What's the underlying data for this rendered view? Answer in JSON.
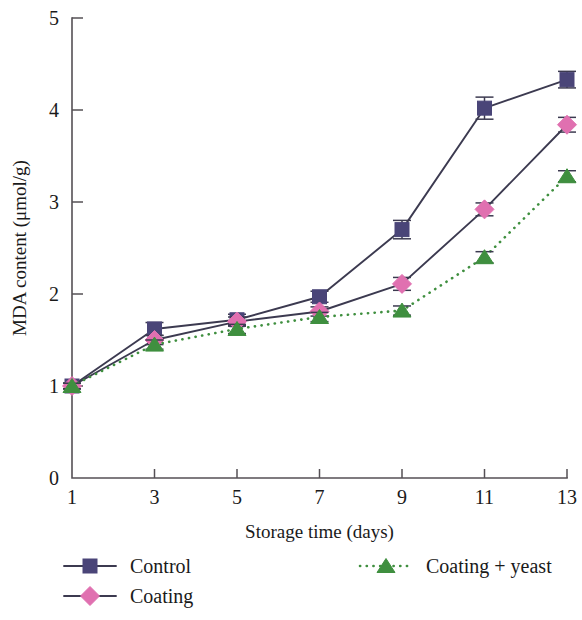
{
  "chart_data": {
    "type": "line",
    "title": "",
    "xlabel": "Storage time (days)",
    "ylabel": "MDA content (μmol/g)",
    "x": [
      1,
      3,
      5,
      7,
      9,
      11,
      13
    ],
    "xtick_labels": [
      "1",
      "3",
      "5",
      "7",
      "9",
      "11",
      "13"
    ],
    "ytick_labels": [
      "0",
      "1",
      "2",
      "3",
      "4",
      "5"
    ],
    "yticks": [
      0,
      1,
      2,
      3,
      4,
      5
    ],
    "xlim": [
      1,
      13
    ],
    "ylim": [
      0,
      5
    ],
    "grid": false,
    "legend_position": "below-axes",
    "series": [
      {
        "name": "Control",
        "color": "#4a4578",
        "marker": "square",
        "linestyle": "solid",
        "values": [
          1.0,
          1.62,
          1.72,
          1.97,
          2.7,
          4.02,
          4.33
        ],
        "errors": [
          0.03,
          0.07,
          0.06,
          0.06,
          0.1,
          0.12,
          0.09
        ]
      },
      {
        "name": "Coating",
        "color": "#e070b0",
        "marker": "diamond",
        "linestyle": "solid",
        "values": [
          1.0,
          1.5,
          1.7,
          1.81,
          2.11,
          2.92,
          3.84
        ],
        "errors": [
          0.03,
          0.05,
          0.05,
          0.05,
          0.07,
          0.07,
          0.08
        ]
      },
      {
        "name": "Coating + yeast",
        "color": "#3f8f3f",
        "marker": "triangle",
        "linestyle": "dotted",
        "values": [
          1.0,
          1.45,
          1.62,
          1.75,
          1.82,
          2.4,
          3.28
        ],
        "errors": [
          0.03,
          0.05,
          0.05,
          0.05,
          0.05,
          0.06,
          0.06
        ]
      }
    ]
  },
  "legend": {
    "entries": [
      {
        "label": "Control",
        "column": "left"
      },
      {
        "label": "Coating",
        "column": "left"
      },
      {
        "label": "Coating + yeast",
        "column": "right"
      }
    ]
  },
  "axes": {
    "x_title": "Storage time (days)",
    "y_title": "MDA content (μmol/g)"
  }
}
